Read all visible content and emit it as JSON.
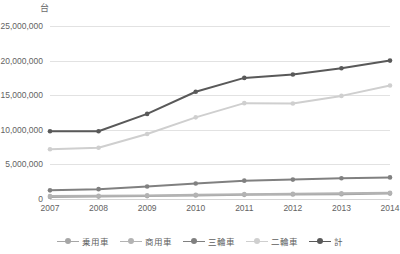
{
  "chart_data": {
    "type": "line",
    "title": "",
    "unit_label": "台",
    "xlabel": "",
    "ylabel": "",
    "categories": [
      "2007",
      "2008",
      "2009",
      "2010",
      "2011",
      "2012",
      "2013",
      "2014"
    ],
    "x": [
      2007,
      2008,
      2009,
      2010,
      2011,
      2012,
      2013,
      2014
    ],
    "ylim": [
      0,
      25000000
    ],
    "ytick_values": [
      0,
      5000000,
      10000000,
      15000000,
      20000000,
      25000000
    ],
    "ytick_labels": [
      "0",
      "5,000,000",
      "10,000,000",
      "15,000,000",
      "20,000,000",
      "25,000,000"
    ],
    "grid": true,
    "legend_position": "bottom",
    "series": [
      {
        "name": "乗用車",
        "color": "#a6a6a6",
        "values": [
          300000,
          350000,
          420000,
          520000,
          600000,
          650000,
          700000,
          780000
        ]
      },
      {
        "name": "商用車",
        "color": "#b3b3b3",
        "values": [
          420000,
          460000,
          520000,
          620000,
          700000,
          760000,
          820000,
          900000
        ]
      },
      {
        "name": "三輪車",
        "color": "#808080",
        "values": [
          1250000,
          1420000,
          1800000,
          2250000,
          2650000,
          2800000,
          3000000,
          3120000
        ]
      },
      {
        "name": "二輪車",
        "color": "#cfcfcf",
        "values": [
          7200000,
          7400000,
          9400000,
          11800000,
          13850000,
          13800000,
          14900000,
          16400000
        ]
      },
      {
        "name": "計",
        "color": "#595959",
        "values": [
          9800000,
          9800000,
          12300000,
          15500000,
          17500000,
          18000000,
          18900000,
          20000000
        ]
      }
    ]
  }
}
